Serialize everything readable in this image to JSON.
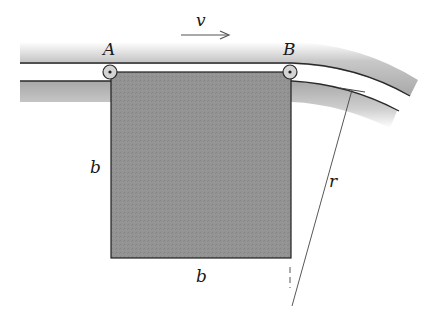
{
  "diagram": {
    "type": "mechanics-figure",
    "labels": {
      "velocity": "v",
      "point_a": "A",
      "point_b": "B",
      "side_vertical": "b",
      "side_horizontal": "b",
      "radius": "r"
    },
    "colors": {
      "track_shade": "#b8b8b8",
      "plate_fill": "#8f8f8f",
      "line": "#222222",
      "roller_fill": "#d0d0d0"
    }
  }
}
